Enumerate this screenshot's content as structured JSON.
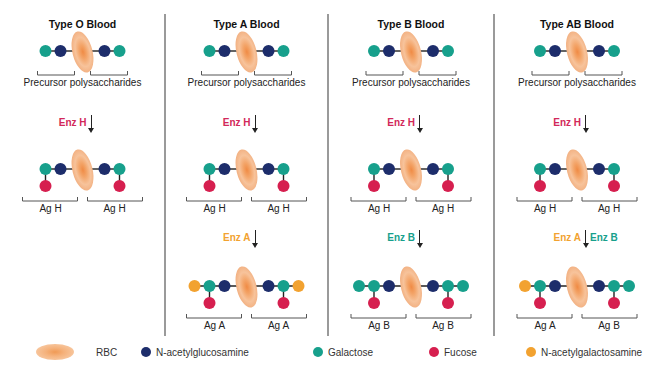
{
  "colors": {
    "rbc": "#f5b584",
    "n_acetylglucosamine": "#1d2d6b",
    "galactose": "#17a08c",
    "fucose": "#d61f4f",
    "n_acetylgalactosamine": "#f2a230",
    "enz_h": "#d2285a",
    "enz_a": "#f2a230",
    "enz_b": "#17a08c",
    "divider": "#9a9a9a"
  },
  "panels": [
    {
      "id": "type-o",
      "title": "Type O Blood",
      "precursor_label": "Precursor polysaccharides",
      "step1": {
        "enzymes": [
          {
            "label": "Enz H",
            "color": "enz_h"
          }
        ]
      },
      "stage2": {
        "left_label": "Ag H",
        "right_label": "Ag H"
      },
      "step2": null,
      "stage3": null
    },
    {
      "id": "type-a",
      "title": "Type A Blood",
      "precursor_label": "Precursor polysaccharides",
      "step1": {
        "enzymes": [
          {
            "label": "Enz H",
            "color": "enz_h"
          }
        ]
      },
      "stage2": {
        "left_label": "Ag H",
        "right_label": "Ag H"
      },
      "step2": {
        "enzymes": [
          {
            "label": "Enz A",
            "color": "enz_a"
          }
        ]
      },
      "stage3": {
        "left_label": "Ag A",
        "right_label": "Ag A",
        "left_end": "n_acetylgalactosamine",
        "right_end": "n_acetylgalactosamine"
      }
    },
    {
      "id": "type-b",
      "title": "Type B Blood",
      "precursor_label": "Precursor polysaccharides",
      "step1": {
        "enzymes": [
          {
            "label": "Enz H",
            "color": "enz_h"
          }
        ]
      },
      "stage2": {
        "left_label": "Ag H",
        "right_label": "Ag H"
      },
      "step2": {
        "enzymes": [
          {
            "label": "Enz B",
            "color": "enz_b"
          }
        ]
      },
      "stage3": {
        "left_label": "Ag B",
        "right_label": "Ag B",
        "left_end": "galactose",
        "right_end": "galactose"
      }
    },
    {
      "id": "type-ab",
      "title": "Type AB Blood",
      "precursor_label": "Precursor polysaccharides",
      "step1": {
        "enzymes": [
          {
            "label": "Enz H",
            "color": "enz_h"
          }
        ]
      },
      "stage2": {
        "left_label": "Ag H",
        "right_label": "Ag H"
      },
      "step2": {
        "enzymes": [
          {
            "label": "Enz A",
            "color": "enz_a"
          },
          {
            "label": "Enz B",
            "color": "enz_b"
          }
        ]
      },
      "stage3": {
        "left_label": "Ag A",
        "right_label": "Ag B",
        "left_end": "n_acetylgalactosamine",
        "right_end": "galactose"
      }
    }
  ],
  "legend": [
    {
      "key": "rbc",
      "label": "RBC"
    },
    {
      "key": "n_acetylglucosamine",
      "label": "N-acetylglucosamine"
    },
    {
      "key": "galactose",
      "label": "Galactose"
    },
    {
      "key": "fucose",
      "label": "Fucose"
    },
    {
      "key": "n_acetylgalactosamine",
      "label": "N-acetylgalactosamine"
    }
  ]
}
